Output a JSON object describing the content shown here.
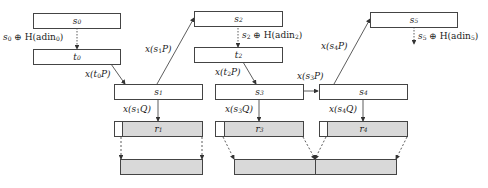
{
  "diagram": {
    "states": [
      {
        "id": "s0",
        "label": "s",
        "sub": "0"
      },
      {
        "id": "t0",
        "label": "t",
        "sub": "0"
      },
      {
        "id": "s1",
        "label": "s",
        "sub": "1"
      },
      {
        "id": "s2",
        "label": "s",
        "sub": "2"
      },
      {
        "id": "t2",
        "label": "t",
        "sub": "2"
      },
      {
        "id": "s3",
        "label": "s",
        "sub": "3"
      },
      {
        "id": "s4",
        "label": "s",
        "sub": "4"
      },
      {
        "id": "s5",
        "label": "s",
        "sub": "5"
      }
    ],
    "outputs": [
      {
        "id": "r1",
        "label": "r",
        "sub": "1"
      },
      {
        "id": "r3",
        "label": "r",
        "sub": "3"
      },
      {
        "id": "r4",
        "label": "r",
        "sub": "4"
      }
    ],
    "edge_labels": {
      "s0_t0": {
        "pre": "s",
        "sub": "0",
        "post": " ⊕ H(adin",
        "sub2": "0",
        "end": ")"
      },
      "s2_t2": {
        "pre": "s",
        "sub": "2",
        "post": " ⊕ H(adin",
        "sub2": "2",
        "end": ")"
      },
      "s5_next": {
        "pre": "s",
        "sub": "5",
        "post": " ⊕ H(adin",
        "sub2": "5",
        "end": ")"
      },
      "t0_s1": {
        "pre": "x(t",
        "sub": "0",
        "post": "P)"
      },
      "s1_s2": {
        "pre": "x(s",
        "sub": "1",
        "post": "P)"
      },
      "t2_s3": {
        "pre": "x(t",
        "sub": "2",
        "post": "P)"
      },
      "s3_s4": {
        "pre": "x(s",
        "sub": "3",
        "post": "P)"
      },
      "s4_s5": {
        "pre": "x(s",
        "sub": "4",
        "post": "P)"
      },
      "s1_r1": {
        "pre": "x(s",
        "sub": "1",
        "post": "Q)"
      },
      "s3_r3": {
        "pre": "x(s",
        "sub": "3",
        "post": "Q)"
      },
      "s4_r4": {
        "pre": "x(s",
        "sub": "4",
        "post": "Q)"
      }
    },
    "colors": {
      "stroke": "#444444",
      "shade": "#d9d9d9",
      "background": "#ffffff"
    }
  }
}
